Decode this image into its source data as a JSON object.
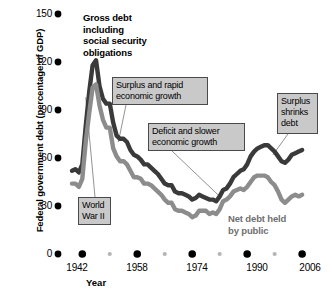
{
  "chart_data": {
    "type": "line",
    "title": "",
    "xlabel": "Year",
    "ylabel": "Federal government debt (percentage of GDP)",
    "xlim": [
      1939,
      2008
    ],
    "ylim": [
      0,
      150
    ],
    "grid": false,
    "legend": "inline-labels",
    "y_ticks": [
      0,
      30,
      60,
      90,
      120,
      150
    ],
    "y_tick_labels": [
      "0",
      "30",
      "60",
      "90",
      "120",
      "150"
    ],
    "x_ticks": [
      1942,
      1958,
      1974,
      1990,
      2006
    ],
    "x_tick_labels": [
      "1942",
      "1958",
      "1974",
      "1990",
      "2006"
    ],
    "x_minor_ticks": [
      1950,
      1966,
      1982,
      1998
    ],
    "series": [
      {
        "name": "Gross debt including social security obligations",
        "color": "#3a3a3a",
        "x": [
          1939,
          1940,
          1941,
          1942,
          1943,
          1944,
          1945,
          1946,
          1947,
          1948,
          1949,
          1950,
          1951,
          1952,
          1953,
          1954,
          1955,
          1956,
          1957,
          1958,
          1959,
          1960,
          1961,
          1962,
          1963,
          1964,
          1965,
          1966,
          1967,
          1968,
          1969,
          1970,
          1971,
          1972,
          1973,
          1974,
          1975,
          1976,
          1977,
          1978,
          1979,
          1980,
          1981,
          1982,
          1983,
          1984,
          1985,
          1986,
          1987,
          1988,
          1989,
          1990,
          1991,
          1992,
          1993,
          1994,
          1995,
          1996,
          1997,
          1998,
          1999,
          2000,
          2001,
          2002,
          2003,
          2004,
          2005,
          2006
        ],
        "values": [
          52,
          53,
          51,
          56,
          80,
          101,
          118,
          121,
          105,
          97,
          94,
          94,
          82,
          74,
          72,
          72,
          70,
          65,
          62,
          61,
          59,
          56,
          56,
          54,
          52,
          50,
          47,
          44,
          43,
          43,
          39,
          38,
          38,
          37,
          36,
          34,
          35,
          37,
          36,
          35,
          34,
          34,
          33,
          36,
          40,
          41,
          44,
          48,
          50,
          52,
          53,
          56,
          61,
          64,
          66,
          67,
          68,
          68,
          66,
          64,
          61,
          58,
          57,
          59,
          62,
          63,
          64,
          65
        ]
      },
      {
        "name": "Net debt held by public",
        "color": "#8c8c8c",
        "x": [
          1939,
          1940,
          1941,
          1942,
          1943,
          1944,
          1945,
          1946,
          1947,
          1948,
          1949,
          1950,
          1951,
          1952,
          1953,
          1954,
          1955,
          1956,
          1957,
          1958,
          1959,
          1960,
          1961,
          1962,
          1963,
          1964,
          1965,
          1966,
          1967,
          1968,
          1969,
          1970,
          1971,
          1972,
          1973,
          1974,
          1975,
          1976,
          1977,
          1978,
          1979,
          1980,
          1981,
          1982,
          1983,
          1984,
          1985,
          1986,
          1987,
          1988,
          1989,
          1990,
          1991,
          1992,
          1993,
          1994,
          1995,
          1996,
          1997,
          1998,
          1999,
          2000,
          2001,
          2002,
          2003,
          2004,
          2005,
          2006
        ],
        "values": [
          44,
          44,
          42,
          47,
          70,
          88,
          104,
          106,
          93,
          84,
          79,
          79,
          66,
          61,
          58,
          58,
          56,
          52,
          48,
          48,
          47,
          44,
          44,
          43,
          41,
          39,
          37,
          34,
          32,
          32,
          28,
          27,
          27,
          26,
          25,
          23,
          24,
          27,
          27,
          27,
          25,
          26,
          25,
          28,
          33,
          34,
          36,
          39,
          40,
          41,
          40,
          42,
          45,
          48,
          49,
          49,
          49,
          48,
          45,
          43,
          39,
          34,
          32,
          34,
          36,
          37,
          36,
          37
        ]
      }
    ],
    "annotations": [
      {
        "id": "wwii",
        "text": "World\nWar II",
        "points_to": [
          1943,
          98
        ]
      },
      {
        "id": "surplus-rapid",
        "text": "Surplus and rapid\neconomic growth",
        "points_to": [
          1952,
          70
        ]
      },
      {
        "id": "deficit",
        "text": "Deficit and slower\neconomic growth",
        "points_to": [
          1982,
          36
        ]
      },
      {
        "id": "surplus-shrinks",
        "text": "Surplus\nshrinks\ndebt",
        "points_to": [
          1998,
          63
        ]
      }
    ],
    "series_labels": [
      {
        "id": "gross-debt",
        "text": "Gross debt\nincluding\nsocial security\nobligations"
      },
      {
        "id": "net-debt",
        "text": "Net debt held\nby public"
      }
    ]
  },
  "axes": {
    "y_title": "Federal government debt (percentage of GDP)",
    "x_title": "Year",
    "y_labels": [
      "150",
      "120",
      "90",
      "60",
      "30",
      "0"
    ],
    "x_labels": [
      "1942",
      "1958",
      "1974",
      "1990",
      "2006"
    ]
  },
  "colors": {
    "gross_debt_line": "#3a3a3a",
    "net_debt_line": "#8c8c8c",
    "callout_fill": "#c9c9c9",
    "callout_border": "#4a4a4a",
    "tick_major": "#000000",
    "tick_minor": "#b5b5b5",
    "background": "#ffffff"
  }
}
